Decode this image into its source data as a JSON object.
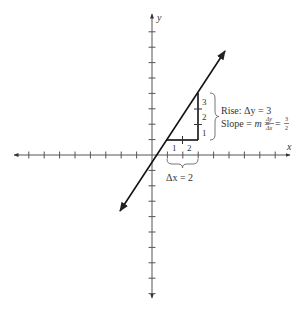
{
  "diagram": {
    "axes": {
      "x_label": "x",
      "y_label": "y",
      "origin_px": [
        152,
        155
      ],
      "unit_px": 15.4,
      "x_ticks_left": 8,
      "x_ticks_right": 8,
      "y_ticks_up": 8,
      "y_ticks_down": 9
    },
    "line": {
      "through_points": [
        [
          1,
          1
        ],
        [
          3,
          4
        ]
      ],
      "slope_num": 3,
      "slope_den": 2,
      "color": "#111111"
    },
    "run": {
      "tick_labels": [
        "1",
        "2"
      ],
      "label": "Δx = 2"
    },
    "rise": {
      "tick_labels": [
        "1",
        "2",
        "3"
      ],
      "label": "Rise: Δy = 3"
    },
    "slope": {
      "prefix": "Slope = ",
      "m": "m",
      "eq": " = ",
      "frac_num": "Δy",
      "frac_den": "Δx",
      "eq2": " = ",
      "val_num": "3",
      "val_den": "2"
    }
  }
}
